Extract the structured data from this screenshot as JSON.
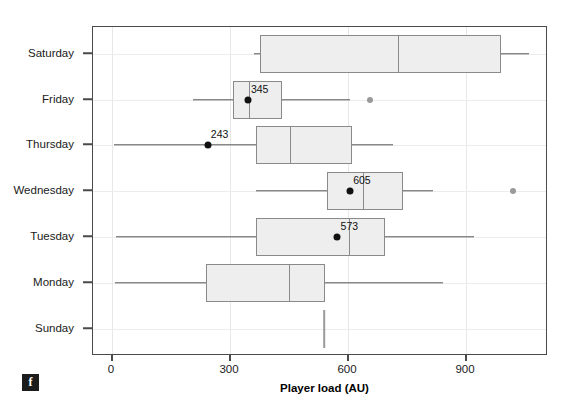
{
  "figure": {
    "badge_label": "f",
    "xaxis_title": "Player load (AU)"
  },
  "chart_data": {
    "type": "box",
    "orientation": "horizontal",
    "title": "",
    "xlabel": "Player load (AU)",
    "ylabel": "",
    "xlim": [
      -50,
      1108
    ],
    "xticks": [
      0,
      300,
      600,
      900
    ],
    "xtick_labels": [
      "0",
      "300",
      "600",
      "900"
    ],
    "categories": [
      "Saturday",
      "Friday",
      "Thursday",
      "Wednesday",
      "Tuesday",
      "Monday",
      "Sunday"
    ],
    "grid": "vertical-and-horizontal-light",
    "legend": "none",
    "mean_marker": "black-filled-circle-with-value-label",
    "outlier_marker": "grey-filled-circle",
    "colors": {
      "box_fill": "#eeeeee",
      "box_edge": "#8a8a8a",
      "whisker": "#555555",
      "mean_dot": "#111111",
      "outlier": "#9a9a9a",
      "frame": "#4a4a4a",
      "grid": "#e8e8e8"
    },
    "boxes": [
      {
        "category": "Saturday",
        "whisker_low": 361,
        "q1": 376,
        "median": 727,
        "q3": 989,
        "whisker_high": 1060,
        "mean": null,
        "mean_label": null,
        "outliers": []
      },
      {
        "category": "Friday",
        "whisker_low": 206,
        "q1": 308,
        "median": 348,
        "q3": 432,
        "whisker_high": 605,
        "mean": 345,
        "mean_label": "345",
        "outliers": [
          656
        ]
      },
      {
        "category": "Thursday",
        "whisker_low": 5,
        "q1": 366,
        "median": 453,
        "q3": 610,
        "whisker_high": 714,
        "mean": 243,
        "mean_label": "243",
        "outliers": []
      },
      {
        "category": "Wednesday",
        "whisker_low": 366,
        "q1": 547,
        "median": 638,
        "q3": 740,
        "whisker_high": 816,
        "mean": 605,
        "mean_label": "605",
        "outliers": [
          1020
        ]
      },
      {
        "category": "Tuesday",
        "whisker_low": 10,
        "q1": 366,
        "median": 603,
        "q3": 694,
        "whisker_high": 921,
        "mean": 573,
        "mean_label": "573",
        "outliers": []
      },
      {
        "category": "Monday",
        "whisker_low": 8,
        "q1": 239,
        "median": 450,
        "q3": 542,
        "whisker_high": 842,
        "mean": null,
        "mean_label": null,
        "outliers": []
      },
      {
        "category": "Sunday",
        "whisker_low": 539,
        "q1": 539,
        "median": 539,
        "q3": 539,
        "whisker_high": 539,
        "mean": null,
        "mean_label": null,
        "outliers": [],
        "degenerate": true
      }
    ]
  }
}
